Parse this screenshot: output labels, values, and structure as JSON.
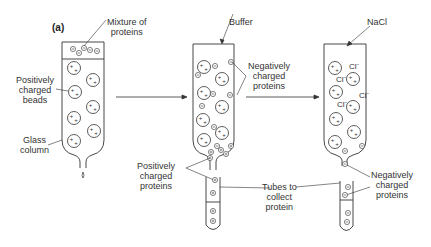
{
  "panel_label": "(a)",
  "labels": {
    "mixture": [
      "Mixture of",
      "proteins"
    ],
    "pos_beads": [
      "Positively",
      "charged",
      "beads"
    ],
    "glass_column": [
      "Glass",
      "column"
    ],
    "buffer": "Buffer",
    "neg_proteins_1": [
      "Negatively",
      "charged",
      "proteins"
    ],
    "pos_proteins": [
      "Positively",
      "charged",
      "proteins"
    ],
    "tubes": [
      "Tubes to",
      "collect",
      "protein"
    ],
    "nacl": "NaCl",
    "neg_proteins_2": [
      "Negatively",
      "charged",
      "proteins"
    ]
  },
  "symbols": {
    "plus": "+",
    "minus": "−",
    "chloride": "Cl⁻"
  },
  "colors": {
    "stroke": "#333333",
    "text": "#333333"
  }
}
